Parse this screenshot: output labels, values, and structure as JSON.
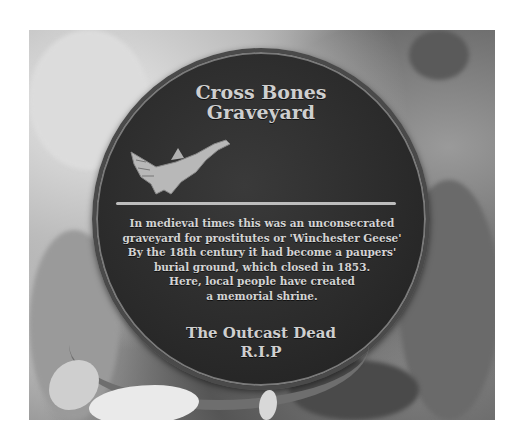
{
  "image": {
    "description": "Photograph of a round bronze memorial plaque surrounded by flowers and ribbons",
    "plaque": {
      "title_lines": [
        "Cross Bones",
        "Graveyard"
      ],
      "emblem": "goose-icon",
      "body_lines": [
        "In medieval times this was an unconsecrated",
        "graveyard for prostitutes or 'Winchester Geese'",
        "By the 18th century it had become a paupers'",
        "burial ground, which closed in 1853.",
        "Here, local people have created",
        "a memorial shrine."
      ],
      "footer_lines": [
        "The Outcast Dead",
        "R.I.P"
      ]
    },
    "colors": {
      "plaque": "#2a2a2a",
      "lettering": "#cfcfcf",
      "background": "#ffffff"
    }
  }
}
